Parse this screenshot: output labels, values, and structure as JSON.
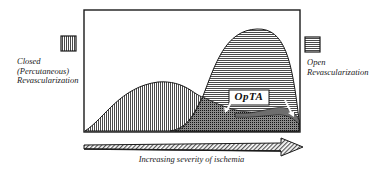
{
  "diagram": {
    "legend": {
      "closed": {
        "label_lines": [
          "Closed",
          "(Percutaneous)",
          "Revascularization"
        ],
        "pattern": "vertical-hatch"
      },
      "open": {
        "label_lines": [
          "Open",
          "Revascularization"
        ],
        "pattern": "horizontal-hatch"
      }
    },
    "overlap_label": "OpTA",
    "x_axis_label": "Increasing severity of ischemia",
    "colors": {
      "line": "#1a1a1a",
      "background": "#ffffff",
      "hatch": "#555555"
    }
  }
}
